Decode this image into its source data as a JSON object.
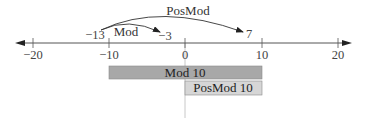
{
  "diagram": {
    "title": "",
    "axis": {
      "min": -20,
      "max": 20,
      "ticks": [
        {
          "value": -20,
          "label": "−20"
        },
        {
          "value": -10,
          "label": "−10"
        },
        {
          "value": 0,
          "label": "0"
        },
        {
          "value": 10,
          "label": "10"
        },
        {
          "value": 20,
          "label": "20"
        }
      ],
      "arrows": "both"
    },
    "points": [
      {
        "value": -13,
        "label": "−13"
      },
      {
        "value": -3,
        "label": "−3"
      },
      {
        "value": 7,
        "label": "7"
      }
    ],
    "arcs": [
      {
        "name": "mod-arc",
        "from": -13,
        "to": -3,
        "label": "Mod"
      },
      {
        "name": "posmod-arc",
        "from": -13,
        "to": 7,
        "label": "PosMod"
      }
    ],
    "ranges": [
      {
        "name": "mod-10-range",
        "label": "Mod 10",
        "from": -10,
        "to": 10,
        "color": "#a8a8a8"
      },
      {
        "name": "posmod-10-range",
        "label": "PosMod 10",
        "from": 0,
        "to": 10,
        "color": "#d6d6d6"
      }
    ],
    "colors": {
      "axis": "#333333",
      "zero_line": "#c8c8c8",
      "bar_border": "#8a8a8a"
    }
  }
}
